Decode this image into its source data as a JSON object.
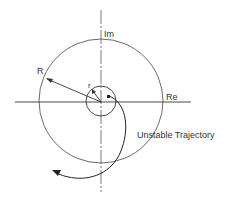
{
  "diagram": {
    "labels": {
      "im_axis": "Im",
      "re_axis": "Re",
      "outer_radius": "R",
      "inner_radius": "r",
      "trajectory": "Unstable Trajectory"
    },
    "colors": {
      "stroke": "#333333",
      "background": "#ffffff"
    }
  }
}
